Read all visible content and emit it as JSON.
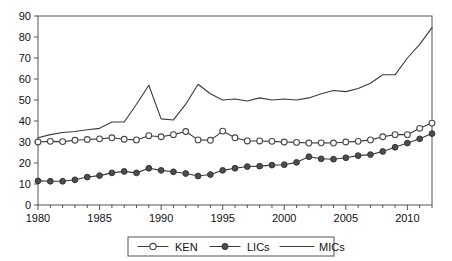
{
  "chart_data": {
    "type": "line",
    "title": "",
    "subtitle": "",
    "xlabel": "",
    "ylabel": "",
    "xlim": [
      1980,
      2012
    ],
    "ylim": [
      0,
      90
    ],
    "ytick_labels": [
      "0",
      "10",
      "20",
      "30",
      "40",
      "50",
      "60",
      "70",
      "80",
      "90"
    ],
    "ytick_values": [
      0,
      10,
      20,
      30,
      40,
      50,
      60,
      70,
      80,
      90
    ],
    "xtick_labels": [
      "1980",
      "1985",
      "1990",
      "1995",
      "2000",
      "2005",
      "2010"
    ],
    "xtick_values": [
      1980,
      1985,
      1990,
      1995,
      2000,
      2005,
      2010
    ],
    "x": [
      1980,
      1981,
      1982,
      1983,
      1984,
      1985,
      1986,
      1987,
      1988,
      1989,
      1990,
      1991,
      1992,
      1993,
      1994,
      1995,
      1996,
      1997,
      1998,
      1999,
      2000,
      2001,
      2002,
      2003,
      2004,
      2005,
      2006,
      2007,
      2008,
      2009,
      2010,
      2011,
      2012
    ],
    "grid": false,
    "legend_position": "bottom-center",
    "series": [
      {
        "name": "KEN",
        "marker": "open-circle",
        "values": [
          30.0,
          30.3,
          30.2,
          30.8,
          31.2,
          31.5,
          32.0,
          31.3,
          31.0,
          33.0,
          32.5,
          33.5,
          35.0,
          31.0,
          30.8,
          35.2,
          32.0,
          30.5,
          30.5,
          30.3,
          30.0,
          29.8,
          29.5,
          29.6,
          29.5,
          30.0,
          30.3,
          31.0,
          32.5,
          33.5,
          33.5,
          36.5,
          39.0
        ]
      },
      {
        "name": "LICs",
        "marker": "filled-circle",
        "values": [
          11.5,
          11.3,
          11.3,
          12.0,
          13.3,
          14.0,
          15.3,
          16.0,
          15.3,
          17.5,
          16.5,
          15.8,
          15.0,
          13.8,
          14.5,
          16.5,
          17.5,
          18.3,
          18.5,
          19.0,
          19.2,
          20.3,
          23.0,
          22.0,
          21.8,
          22.5,
          23.5,
          24.0,
          25.5,
          27.5,
          29.5,
          31.5,
          34.0
        ]
      },
      {
        "name": "MICs",
        "marker": "none",
        "values": [
          32.0,
          33.5,
          34.5,
          35.0,
          35.8,
          36.5,
          39.5,
          39.5,
          48.0,
          57.0,
          41.0,
          40.5,
          48.0,
          57.5,
          53.0,
          50.0,
          50.5,
          49.5,
          51.0,
          50.0,
          50.5,
          50.0,
          51.0,
          53.0,
          54.5,
          54.0,
          55.5,
          58.0,
          62.0,
          62.0,
          70.0,
          76.5,
          84.5
        ]
      }
    ]
  },
  "legend": {
    "entries": [
      {
        "label": "KEN",
        "marker": "open-circle"
      },
      {
        "label": "LICs",
        "marker": "filled-circle"
      },
      {
        "label": "MICs",
        "marker": "line"
      }
    ]
  }
}
